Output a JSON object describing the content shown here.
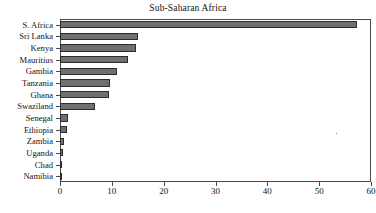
{
  "chart_data": {
    "type": "bar",
    "orientation": "horizontal",
    "title": "Sub-Saharan Africa",
    "xlabel": "",
    "ylabel": "",
    "xlim": [
      0,
      60
    ],
    "xticks": [
      0,
      10,
      20,
      30,
      40,
      50,
      60
    ],
    "grid": false,
    "legend": null,
    "bar_color": "#6f6f6f",
    "bar_edge_color": "#2d2d2d",
    "axis_color": "#4a4a4a",
    "background": "#ffffff",
    "categories": [
      "S. Africa",
      "Sri Lanka",
      "Kenya",
      "Mauritius",
      "Gambia",
      "Tanzania",
      "Ghana",
      "Swaziland",
      "Senegal",
      "Ethiopia",
      "Zambia",
      "Uganda",
      "Chad",
      "Namibia"
    ],
    "values": [
      57.3,
      15.1,
      14.7,
      13.1,
      11.0,
      9.6,
      9.5,
      6.7,
      1.5,
      1.3,
      0.8,
      0.5,
      0.45,
      0.4
    ]
  }
}
